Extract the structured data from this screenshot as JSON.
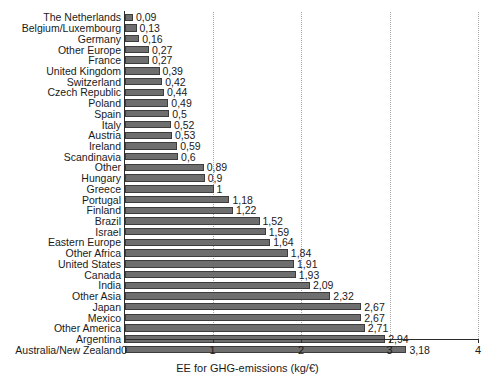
{
  "chart_data": {
    "type": "bar",
    "orientation": "horizontal",
    "title": "",
    "xlabel": "EE for GHG-emissions (kg/€)",
    "ylabel": "",
    "xlim": [
      0,
      4
    ],
    "xticks": [
      "0",
      "1",
      "2",
      "3",
      "4"
    ],
    "xtick_values": [
      0,
      1,
      2,
      3,
      4
    ],
    "grid": "vertical dotted gridlines at 1, 2, 3, 4",
    "legend": "none",
    "decimal_separator": ",",
    "bar_color": "#6e6e6e",
    "bar_edge_color": "#3d3d3d",
    "categories": [
      "The Netherlands",
      "Belgium/Luxembourg",
      "Germany",
      "Other Europe",
      "France",
      "United Kingdom",
      "Switzerland",
      "Czech Republic",
      "Poland",
      "Spain",
      "Italy",
      "Austria",
      "Ireland",
      "Scandinavia",
      "Other",
      "Hungary",
      "Greece",
      "Portugal",
      "Finland",
      "Brazil",
      "Israel",
      "Eastern Europe",
      "Other Africa",
      "United States",
      "Canada",
      "India",
      "Other Asia",
      "Japan",
      "Mexico",
      "Other America",
      "Argentina",
      "Australia/New Zealand"
    ],
    "values": [
      0.09,
      0.13,
      0.16,
      0.27,
      0.27,
      0.39,
      0.42,
      0.44,
      0.49,
      0.5,
      0.52,
      0.53,
      0.59,
      0.6,
      0.89,
      0.9,
      1,
      1.18,
      1.22,
      1.52,
      1.59,
      1.64,
      1.84,
      1.91,
      1.93,
      2.09,
      2.32,
      2.67,
      2.67,
      2.71,
      2.94,
      3.18
    ],
    "value_labels": [
      "0,09",
      "0,13",
      "0,16",
      "0,27",
      "0,27",
      "0,39",
      "0,42",
      "0,44",
      "0,49",
      "0,5",
      "0,52",
      "0,53",
      "0,59",
      "0,6",
      "0,89",
      "0,9",
      "1",
      "1,18",
      "1,22",
      "1,52",
      "1,59",
      "1,64",
      "1,84",
      "1,91",
      "1,93",
      "2,09",
      "2,32",
      "2,67",
      "2,67",
      "2,71",
      "2,94",
      "3,18"
    ]
  }
}
